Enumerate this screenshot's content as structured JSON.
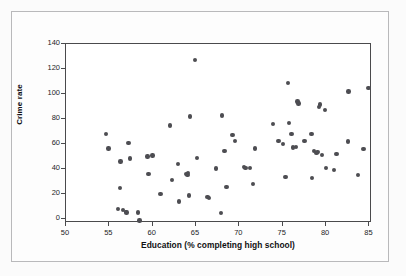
{
  "figure": {
    "background_color": "#fdfdfd",
    "border_color": "#b9b9bb",
    "plot_frame_color": "#4a4a4c",
    "point_color": "#4d4d52"
  },
  "chart_data": {
    "type": "scatter",
    "title": "",
    "xlabel": "Education (% completing high school)",
    "ylabel": "Crime rate",
    "xlim": [
      50,
      85.3
    ],
    "ylim": [
      -3,
      140
    ],
    "xticks": [
      50,
      55,
      60,
      65,
      70,
      75,
      80,
      85
    ],
    "yticks": [
      0,
      20,
      40,
      60,
      80,
      100,
      120,
      140
    ],
    "xtick_labels": [
      "50",
      "55",
      "60",
      "65",
      "70",
      "75",
      "80",
      "85"
    ],
    "ytick_labels": [
      "0",
      "20",
      "40",
      "60",
      "80",
      "100",
      "120",
      "140"
    ],
    "grid": false,
    "legend": null,
    "marker": "filled-circle",
    "marker_color": "#4d4d52",
    "n_points": 67,
    "points": [
      {
        "x": 54.6,
        "y": 68.0
      },
      {
        "x": 54.9,
        "y": 56.5
      },
      {
        "x": 56.0,
        "y": 8.0
      },
      {
        "x": 56.2,
        "y": 25.2
      },
      {
        "x": 56.3,
        "y": 46.0
      },
      {
        "x": 56.6,
        "y": 7.5
      },
      {
        "x": 56.9,
        "y": 6.0
      },
      {
        "x": 57.0,
        "y": 5.5
      },
      {
        "x": 57.2,
        "y": 61.0
      },
      {
        "x": 57.4,
        "y": 48.5
      },
      {
        "x": 58.3,
        "y": 5.5
      },
      {
        "x": 58.5,
        "y": -1.0
      },
      {
        "x": 59.4,
        "y": 50.2
      },
      {
        "x": 59.5,
        "y": 36.3
      },
      {
        "x": 60.0,
        "y": 50.8
      },
      {
        "x": 60.9,
        "y": 20.1
      },
      {
        "x": 62.0,
        "y": 75.0
      },
      {
        "x": 62.2,
        "y": 31.6
      },
      {
        "x": 62.9,
        "y": 44.0
      },
      {
        "x": 63.0,
        "y": 14.2
      },
      {
        "x": 63.9,
        "y": 36.0
      },
      {
        "x": 64.0,
        "y": 35.5
      },
      {
        "x": 64.1,
        "y": 37.0
      },
      {
        "x": 64.2,
        "y": 19.0
      },
      {
        "x": 64.3,
        "y": 82.0
      },
      {
        "x": 64.9,
        "y": 127.0
      },
      {
        "x": 65.1,
        "y": 49.0
      },
      {
        "x": 66.3,
        "y": 17.8
      },
      {
        "x": 66.5,
        "y": 16.8
      },
      {
        "x": 67.3,
        "y": 40.7
      },
      {
        "x": 67.9,
        "y": 5.0
      },
      {
        "x": 68.0,
        "y": 83.0
      },
      {
        "x": 68.3,
        "y": 54.5
      },
      {
        "x": 68.5,
        "y": 25.6
      },
      {
        "x": 69.2,
        "y": 67.3
      },
      {
        "x": 69.5,
        "y": 62.6
      },
      {
        "x": 70.5,
        "y": 41.8
      },
      {
        "x": 70.7,
        "y": 41.0
      },
      {
        "x": 71.2,
        "y": 40.8
      },
      {
        "x": 71.6,
        "y": 28.0
      },
      {
        "x": 71.8,
        "y": 56.6
      },
      {
        "x": 73.9,
        "y": 75.9
      },
      {
        "x": 74.5,
        "y": 62.5
      },
      {
        "x": 75.0,
        "y": 60.0
      },
      {
        "x": 75.3,
        "y": 33.7
      },
      {
        "x": 75.6,
        "y": 108.9
      },
      {
        "x": 75.7,
        "y": 77.0
      },
      {
        "x": 76.0,
        "y": 68.0
      },
      {
        "x": 76.2,
        "y": 57.2
      },
      {
        "x": 76.5,
        "y": 57.8
      },
      {
        "x": 76.7,
        "y": 94.2
      },
      {
        "x": 76.8,
        "y": 92.5
      },
      {
        "x": 77.5,
        "y": 62.6
      },
      {
        "x": 78.3,
        "y": 68.0
      },
      {
        "x": 78.4,
        "y": 33.1
      },
      {
        "x": 78.6,
        "y": 54.5
      },
      {
        "x": 78.9,
        "y": 52.8
      },
      {
        "x": 79.0,
        "y": 53.5
      },
      {
        "x": 79.2,
        "y": 89.5
      },
      {
        "x": 79.3,
        "y": 91.8
      },
      {
        "x": 79.5,
        "y": 51.5
      },
      {
        "x": 79.9,
        "y": 87.5
      },
      {
        "x": 80.0,
        "y": 41.0
      },
      {
        "x": 80.9,
        "y": 39.5
      },
      {
        "x": 81.2,
        "y": 52.0
      },
      {
        "x": 82.5,
        "y": 62.0
      },
      {
        "x": 82.6,
        "y": 102.0
      },
      {
        "x": 83.7,
        "y": 35.2
      },
      {
        "x": 84.3,
        "y": 56.0
      },
      {
        "x": 84.9,
        "y": 105.0
      }
    ]
  }
}
